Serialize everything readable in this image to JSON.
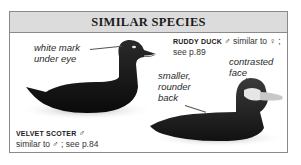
{
  "panel": {
    "title": "SIMILAR SPECIES"
  },
  "velvet_scoter": {
    "name": "VELVET SCOTER",
    "sex_symbol": "♂",
    "description": "similar to ♂ ; see p.84",
    "annotation_line1": "white mark",
    "annotation_line2": "under eye"
  },
  "ruddy_duck": {
    "name": "RUDDY DUCK",
    "sex_symbol": "♂",
    "similar_text": "similar to ♀ ;",
    "see_page": "see p.89",
    "annotation_face_line1": "contrasted",
    "annotation_face_line2": "face",
    "annotation_back_line1": "smaller,",
    "annotation_back_line2": "rounder",
    "annotation_back_line3": "back"
  },
  "colors": {
    "header_bg": "#dcdcdc",
    "border": "#8a8a8a",
    "duck_body": "#111111"
  }
}
